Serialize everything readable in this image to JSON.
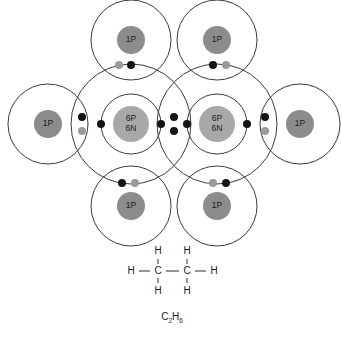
{
  "diagram": {
    "molecule_name": "ethane",
    "molecular_formula": {
      "element_1": "C",
      "subscript_1": "2",
      "element_2": "H",
      "subscript_2": "6"
    },
    "colors": {
      "shell_stroke": "#3b3b3b",
      "carbon_nucleus": "#a8a8a8",
      "hydrogen_nucleus": "#8c8c8c",
      "electron_dark": "#141414",
      "electron_light": "#9a9a9a",
      "background": "#ffffff",
      "text": "#1a1a1a"
    },
    "atoms": [
      {
        "id": "carbon-left",
        "element": "C",
        "nucleus_labels": [
          "6P",
          "6N"
        ],
        "cx": 131,
        "cy": 124,
        "nucleus_r": 18,
        "shells": [
          30,
          60
        ],
        "kind": "carbon"
      },
      {
        "id": "carbon-right",
        "element": "C",
        "nucleus_labels": [
          "6P",
          "6N"
        ],
        "cx": 217,
        "cy": 124,
        "nucleus_r": 18,
        "shells": [
          30,
          60
        ],
        "kind": "carbon"
      },
      {
        "id": "hydrogen-top-left",
        "element": "H",
        "nucleus_labels": [
          "1P"
        ],
        "cx": 131,
        "cy": 40,
        "nucleus_r": 14,
        "shells": [
          40
        ],
        "kind": "hydrogen"
      },
      {
        "id": "hydrogen-top-right",
        "element": "H",
        "nucleus_labels": [
          "1P"
        ],
        "cx": 217,
        "cy": 40,
        "nucleus_r": 14,
        "shells": [
          40
        ],
        "kind": "hydrogen"
      },
      {
        "id": "hydrogen-bottom-left",
        "element": "H",
        "nucleus_labels": [
          "1P"
        ],
        "cx": 131,
        "cy": 206,
        "nucleus_r": 14,
        "shells": [
          40
        ],
        "kind": "hydrogen"
      },
      {
        "id": "hydrogen-bottom-right",
        "element": "H",
        "nucleus_labels": [
          "1P"
        ],
        "cx": 217,
        "cy": 206,
        "nucleus_r": 14,
        "shells": [
          40
        ],
        "kind": "hydrogen"
      },
      {
        "id": "hydrogen-far-left",
        "element": "H",
        "nucleus_labels": [
          "1P"
        ],
        "cx": 48,
        "cy": 124,
        "nucleus_r": 14,
        "shells": [
          40
        ],
        "kind": "hydrogen"
      },
      {
        "id": "hydrogen-far-right",
        "element": "H",
        "nucleus_labels": [
          "1P"
        ],
        "cx": 300,
        "cy": 124,
        "nucleus_r": 14,
        "shells": [
          40
        ],
        "kind": "hydrogen"
      }
    ],
    "inner_shell_electrons": [
      {
        "id": "c-left-inner-e1",
        "cx": 101,
        "cy": 124,
        "shade": "dark"
      },
      {
        "id": "c-left-inner-e2",
        "cx": 161,
        "cy": 124,
        "shade": "dark"
      },
      {
        "id": "c-right-inner-e1",
        "cx": 187,
        "cy": 124,
        "shade": "dark"
      },
      {
        "id": "c-right-inner-e2",
        "cx": 247,
        "cy": 124,
        "shade": "dark"
      }
    ],
    "bond_electrons": [
      {
        "id": "cc-bond-e-upper",
        "cx": 174,
        "cy": 117,
        "shade": "dark"
      },
      {
        "id": "cc-bond-e-lower",
        "cx": 174,
        "cy": 131,
        "shade": "dark"
      },
      {
        "id": "ch-top-left-carbon-e",
        "cx": 131,
        "cy": 65,
        "shade": "dark"
      },
      {
        "id": "ch-top-left-hydrogen-e",
        "cx": 119,
        "cy": 65,
        "shade": "light"
      },
      {
        "id": "ch-top-right-carbon-e",
        "cx": 213,
        "cy": 65,
        "shade": "dark"
      },
      {
        "id": "ch-top-right-hydrogen-e",
        "cx": 226,
        "cy": 65,
        "shade": "light"
      },
      {
        "id": "ch-bottom-left-carbon-e",
        "cx": 122,
        "cy": 183,
        "shade": "dark"
      },
      {
        "id": "ch-bottom-left-hydrogen-e",
        "cx": 135,
        "cy": 183,
        "shade": "light"
      },
      {
        "id": "ch-bottom-right-carbon-e",
        "cx": 226,
        "cy": 183,
        "shade": "dark"
      },
      {
        "id": "ch-bottom-right-hydrogen-e",
        "cx": 213,
        "cy": 183,
        "shade": "light"
      },
      {
        "id": "ch-far-left-carbon-e",
        "cx": 82,
        "cy": 117,
        "shade": "dark"
      },
      {
        "id": "ch-far-left-hydrogen-e",
        "cx": 82,
        "cy": 131,
        "shade": "light"
      },
      {
        "id": "ch-far-right-carbon-e",
        "cx": 265,
        "cy": 117,
        "shade": "dark"
      },
      {
        "id": "ch-far-right-hydrogen-e",
        "cx": 265,
        "cy": 131,
        "shade": "light"
      }
    ],
    "structural_formula": {
      "atoms": [
        {
          "id": "sf-h-top-left",
          "label": "H",
          "x": 158,
          "y": 251
        },
        {
          "id": "sf-h-top-right",
          "label": "H",
          "x": 187,
          "y": 251
        },
        {
          "id": "sf-h-left",
          "label": "H",
          "x": 131,
          "y": 271
        },
        {
          "id": "sf-c-left",
          "label": "C",
          "x": 158,
          "y": 271
        },
        {
          "id": "sf-c-right",
          "label": "C",
          "x": 187,
          "y": 271
        },
        {
          "id": "sf-h-right",
          "label": "H",
          "x": 214,
          "y": 271
        },
        {
          "id": "sf-h-bottom-left",
          "label": "H",
          "x": 158,
          "y": 291
        },
        {
          "id": "sf-h-bottom-right",
          "label": "H",
          "x": 187,
          "y": 291
        }
      ],
      "bonds": [
        {
          "id": "sf-bond-h-c-left",
          "x1": 139,
          "y1": 271,
          "x2": 150,
          "y2": 271
        },
        {
          "id": "sf-bond-c-c",
          "x1": 166,
          "y1": 271,
          "x2": 179,
          "y2": 271
        },
        {
          "id": "sf-bond-c-h-right",
          "x1": 195,
          "y1": 271,
          "x2": 206,
          "y2": 271
        },
        {
          "id": "sf-bond-c-h-topleft",
          "x1": 158,
          "y1": 259,
          "x2": 158,
          "y2": 264
        },
        {
          "id": "sf-bond-c-h-topright",
          "x1": 187,
          "y1": 259,
          "x2": 187,
          "y2": 264
        },
        {
          "id": "sf-bond-c-h-botleft",
          "x1": 158,
          "y1": 278,
          "x2": 158,
          "y2": 283
        },
        {
          "id": "sf-bond-c-h-botright",
          "x1": 187,
          "y1": 278,
          "x2": 187,
          "y2": 283
        }
      ],
      "formula_x": 172,
      "formula_y": 320
    }
  }
}
